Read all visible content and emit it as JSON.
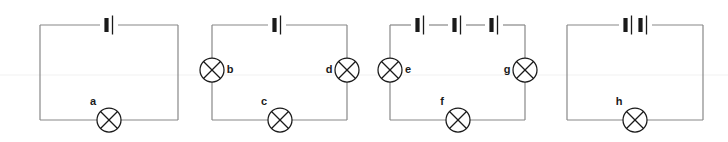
{
  "figure": {
    "width": 728,
    "height": 142,
    "background_color": "#ffffff",
    "wire_color": "#888888",
    "symbol_color": "#1a1a1a",
    "faint_rule_color": "#f6f6f6",
    "faint_rule_y": 75
  },
  "legend": {
    "cell_symbol": "battery-cell",
    "lamp_symbol": "lamp-circle-with-x"
  },
  "circuits": [
    {
      "id": "circuit-1",
      "cells": 1,
      "lamps": [
        "a"
      ],
      "frame": {
        "x1": 40,
        "y1": 25,
        "x2": 178,
        "y2": 120
      },
      "cell_positions": [
        109
      ],
      "lamp_items": [
        {
          "label": "a",
          "position": "bottom",
          "cx": 109,
          "cy": 120,
          "label_x": 93,
          "label_y": 105
        }
      ]
    },
    {
      "id": "circuit-2",
      "cells": 1,
      "lamps": [
        "b",
        "c"
      ],
      "frame": {
        "x1": 212,
        "y1": 25,
        "x2": 347,
        "y2": 120
      },
      "cell_positions": [
        277
      ],
      "lamp_items": [
        {
          "label": "b",
          "position": "left",
          "cx": 212,
          "cy": 70,
          "label_x": 230,
          "label_y": 73
        },
        {
          "label": "c",
          "position": "bottom",
          "cx": 280,
          "cy": 120,
          "label_x": 264,
          "label_y": 105
        },
        {
          "label": "d",
          "position": "right",
          "cx": 347,
          "cy": 70,
          "label_x": 329,
          "label_y": 73
        }
      ]
    },
    {
      "id": "circuit-3",
      "cells": 3,
      "lamps": [
        "e",
        "f",
        "g"
      ],
      "frame": {
        "x1": 390,
        "y1": 25,
        "x2": 525,
        "y2": 120
      },
      "cell_positions": [
        420,
        457,
        494
      ],
      "lamp_items": [
        {
          "label": "e",
          "position": "left",
          "cx": 390,
          "cy": 70,
          "label_x": 408,
          "label_y": 73
        },
        {
          "label": "f",
          "position": "bottom",
          "cx": 458,
          "cy": 120,
          "label_x": 442,
          "label_y": 105
        },
        {
          "label": "g",
          "position": "right",
          "cx": 525,
          "cy": 70,
          "label_x": 507,
          "label_y": 73
        }
      ]
    },
    {
      "id": "circuit-4",
      "cells": 2,
      "lamps": [
        "h"
      ],
      "frame": {
        "x1": 567,
        "y1": 25,
        "x2": 703,
        "y2": 120
      },
      "cell_positions": [
        628,
        643
      ],
      "lamp_items": [
        {
          "label": "h",
          "position": "bottom",
          "cx": 635,
          "cy": 120,
          "label_x": 619,
          "label_y": 105
        }
      ]
    }
  ],
  "labels": {
    "a": "a",
    "b": "b",
    "c": "c",
    "d": "d",
    "e": "e",
    "f": "f",
    "g": "g",
    "h": "h"
  }
}
